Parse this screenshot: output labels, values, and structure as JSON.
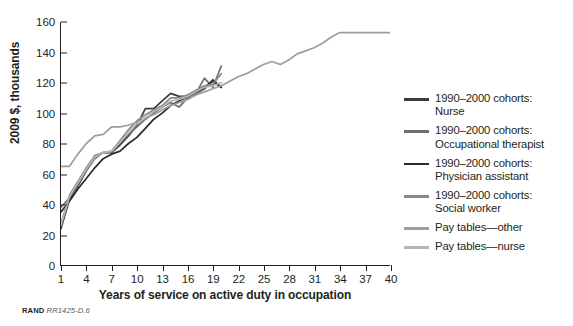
{
  "figure": {
    "source_note_prefix": "RAND",
    "source_note_id": "RR1425-D.6"
  },
  "chart_data": {
    "type": "line",
    "title": "",
    "xlabel": "Years of service on active duty in occupation",
    "ylabel": "2009 $, thousands",
    "xlim": [
      1,
      40
    ],
    "ylim": [
      0,
      160
    ],
    "xticks": [
      1,
      4,
      7,
      10,
      13,
      16,
      19,
      22,
      25,
      28,
      31,
      34,
      37,
      40
    ],
    "yticks": [
      0,
      20,
      40,
      60,
      80,
      100,
      120,
      140,
      160
    ],
    "grid": false,
    "legend_position": "right",
    "series": [
      {
        "name": "1990–2000 cohorts:\nNurse",
        "color": "#3b3b3b",
        "x": [
          1,
          2,
          3,
          4,
          5,
          6,
          7,
          8,
          9,
          10,
          11,
          12,
          13,
          14,
          15,
          16,
          17,
          18,
          19,
          20
        ],
        "values": [
          24,
          43,
          52,
          62,
          71,
          74,
          74,
          79,
          85,
          92,
          103,
          103,
          108,
          113,
          111,
          111,
          113,
          116,
          122,
          117
        ]
      },
      {
        "name": "1990–2000 cohorts:\nOccupational therapist",
        "color": "#6e6e6e",
        "x": [
          1,
          2,
          3,
          4,
          5,
          6,
          7,
          8,
          9,
          10,
          11,
          12,
          13,
          14,
          15,
          16,
          17,
          18,
          19,
          20
        ],
        "values": [
          38,
          44,
          53,
          62,
          70,
          74,
          74,
          80,
          86,
          91,
          96,
          100,
          104,
          107,
          104,
          110,
          113,
          123,
          117,
          131
        ]
      },
      {
        "name": "1990–2000 cohorts:\nPhysician assistant",
        "color": "#2b2b2b",
        "x": [
          1,
          2,
          3,
          4,
          5,
          6,
          7,
          8,
          9,
          10,
          11,
          12,
          13,
          14,
          15,
          16,
          17,
          18,
          19,
          20
        ],
        "values": [
          35,
          42,
          50,
          57,
          64,
          70,
          73,
          75,
          80,
          84,
          90,
          96,
          100,
          105,
          108,
          111,
          114,
          117,
          121,
          117
        ]
      },
      {
        "name": "1990–2000 cohorts:\nSocial worker",
        "color": "#8a8a8a",
        "x": [
          1,
          2,
          3,
          4,
          5,
          6,
          7,
          8,
          9,
          10,
          11,
          12,
          13,
          14,
          15,
          16,
          17,
          18,
          19,
          20
        ],
        "values": [
          27,
          46,
          55,
          64,
          72,
          74,
          75,
          82,
          89,
          95,
          99,
          102,
          105,
          110,
          110,
          112,
          115,
          118,
          119,
          126
        ]
      },
      {
        "name": "Pay tables—other",
        "color": "#9d9d9d",
        "x": [
          1,
          2,
          3,
          4,
          5,
          6,
          7,
          8,
          9,
          10,
          11,
          12,
          13,
          14,
          15,
          16,
          17,
          18,
          19,
          20,
          21,
          22,
          23,
          24,
          25,
          26,
          27,
          28,
          29,
          30,
          31,
          32,
          33,
          34,
          35,
          36,
          37,
          38,
          39,
          40
        ],
        "values": [
          65,
          65,
          73,
          80,
          85,
          86,
          91,
          91,
          92,
          94,
          97,
          99,
          102,
          105,
          107,
          109,
          112,
          114,
          116,
          118,
          121,
          124,
          126,
          129,
          132,
          134,
          132,
          135,
          139,
          141,
          143,
          146,
          150,
          153,
          153,
          153,
          153,
          153,
          153,
          153
        ]
      },
      {
        "name": "Pay tables—nurse",
        "color": "#b5b5b5",
        "x": [
          1,
          2,
          3,
          4,
          5,
          6,
          7,
          8,
          9,
          10,
          11,
          12,
          13,
          14,
          15,
          16,
          17,
          18,
          19,
          20
        ],
        "values": [
          26,
          45,
          54,
          63,
          71,
          74,
          75,
          81,
          87,
          93,
          97,
          101,
          104,
          108,
          109,
          111,
          114,
          117,
          118,
          120
        ]
      }
    ]
  }
}
